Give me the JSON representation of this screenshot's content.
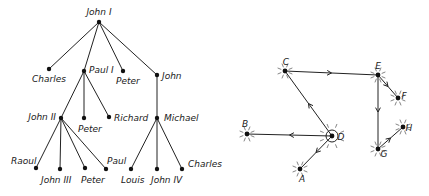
{
  "tree": {
    "nodes": [
      {
        "id": "john1",
        "label": "John I",
        "x": 99,
        "y": 22,
        "lx": 99,
        "ly": 15,
        "anchor": "middle"
      },
      {
        "id": "charles1",
        "label": "Charles",
        "x": 49,
        "y": 69,
        "lx": 32,
        "ly": 82,
        "anchor": "start"
      },
      {
        "id": "paul1",
        "label": "Paul I",
        "x": 84,
        "y": 71,
        "lx": 89,
        "ly": 73,
        "anchor": "start"
      },
      {
        "id": "peter1",
        "label": "Peter",
        "x": 123,
        "y": 71,
        "lx": 116,
        "ly": 84,
        "anchor": "start"
      },
      {
        "id": "john",
        "label": "John",
        "x": 157,
        "y": 75,
        "lx": 162,
        "ly": 79,
        "anchor": "start"
      },
      {
        "id": "john2",
        "label": "John II",
        "x": 61,
        "y": 118,
        "lx": 56,
        "ly": 120,
        "anchor": "end"
      },
      {
        "id": "peter2",
        "label": "Peter",
        "x": 84,
        "y": 118,
        "lx": 78,
        "ly": 132,
        "anchor": "start"
      },
      {
        "id": "richard",
        "label": "Richard",
        "x": 109,
        "y": 117,
        "lx": 114,
        "ly": 121,
        "anchor": "start"
      },
      {
        "id": "michael",
        "label": "Michael",
        "x": 157,
        "y": 118,
        "lx": 164,
        "ly": 121,
        "anchor": "start"
      },
      {
        "id": "raoul",
        "label": "Raoul",
        "x": 36,
        "y": 168,
        "lx": 11,
        "ly": 164,
        "anchor": "start"
      },
      {
        "id": "john3",
        "label": "John III",
        "x": 60,
        "y": 169,
        "lx": 41,
        "ly": 183,
        "anchor": "start"
      },
      {
        "id": "peter3",
        "label": "Peter",
        "x": 85,
        "y": 168,
        "lx": 81,
        "ly": 183,
        "anchor": "start"
      },
      {
        "id": "paul",
        "label": "Paul",
        "x": 106,
        "y": 169,
        "lx": 107,
        "ly": 164,
        "anchor": "start"
      },
      {
        "id": "louis",
        "label": "Louis",
        "x": 131,
        "y": 169,
        "lx": 121,
        "ly": 183,
        "anchor": "start"
      },
      {
        "id": "john4",
        "label": "John IV",
        "x": 157,
        "y": 169,
        "lx": 151,
        "ly": 183,
        "anchor": "start"
      },
      {
        "id": "charles2",
        "label": "Charles",
        "x": 182,
        "y": 169,
        "lx": 188,
        "ly": 167,
        "anchor": "start"
      }
    ],
    "edges": [
      [
        "john1",
        "charles1"
      ],
      [
        "john1",
        "paul1"
      ],
      [
        "john1",
        "peter1"
      ],
      [
        "john1",
        "john"
      ],
      [
        "paul1",
        "john2"
      ],
      [
        "paul1",
        "peter2"
      ],
      [
        "paul1",
        "richard"
      ],
      [
        "john",
        "michael"
      ],
      [
        "john2",
        "raoul"
      ],
      [
        "john2",
        "john3"
      ],
      [
        "john2",
        "peter3"
      ],
      [
        "john2",
        "paul"
      ],
      [
        "michael",
        "louis"
      ],
      [
        "michael",
        "john4"
      ],
      [
        "michael",
        "charles2"
      ]
    ]
  },
  "graph": {
    "nodes": [
      {
        "id": "C",
        "label": "C",
        "x": 285,
        "y": 71,
        "lx": 286,
        "ly": 65,
        "circled": false
      },
      {
        "id": "E",
        "label": "E",
        "x": 378,
        "y": 75,
        "lx": 378,
        "ly": 69,
        "circled": false
      },
      {
        "id": "F",
        "label": "F",
        "x": 398,
        "y": 98,
        "lx": 404,
        "ly": 99,
        "circled": false
      },
      {
        "id": "D",
        "label": "D",
        "x": 332,
        "y": 136,
        "lx": 341,
        "ly": 140,
        "circled": true
      },
      {
        "id": "B",
        "label": "B",
        "x": 247,
        "y": 134,
        "lx": 245,
        "ly": 127,
        "circled": false
      },
      {
        "id": "A",
        "label": "A",
        "x": 300,
        "y": 169,
        "lx": 302,
        "ly": 182,
        "circled": false
      },
      {
        "id": "G",
        "label": "G",
        "x": 378,
        "y": 149,
        "lx": 384,
        "ly": 157,
        "circled": false
      },
      {
        "id": "H",
        "label": "H",
        "x": 403,
        "y": 127,
        "lx": 409,
        "ly": 131,
        "circled": false
      }
    ],
    "edges": [
      {
        "from": "C",
        "to": "E"
      },
      {
        "from": "E",
        "to": "F"
      },
      {
        "from": "E",
        "to": "G"
      },
      {
        "from": "G",
        "to": "H"
      },
      {
        "from": "D",
        "to": "C"
      },
      {
        "from": "D",
        "to": "B"
      },
      {
        "from": "D",
        "to": "A"
      }
    ]
  }
}
